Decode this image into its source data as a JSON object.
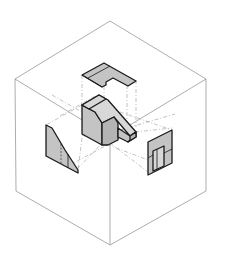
{
  "figure": {
    "description": "Orthographic projection glass-box: isometric cube with an object at center and its top, front(left) and side(right) views projected onto the box faces",
    "colors": {
      "background": "#ffffff",
      "box_lines": "#8a8a8a",
      "projection_lines": "#9a9a9a",
      "object_outline": "#1a1a1a",
      "shade_light": "#d8d8d8",
      "shade_mid": "#c4c4c4",
      "shade_dark": "#b4b4b4"
    },
    "elements": {
      "glass_box": "isometric cube",
      "object": "3D part with slanted face and slot",
      "top_view": "top projection (notched plate)",
      "front_view": "left-face projection (trapezoid)",
      "side_view": "right-face projection (rectangle with slot)"
    }
  }
}
